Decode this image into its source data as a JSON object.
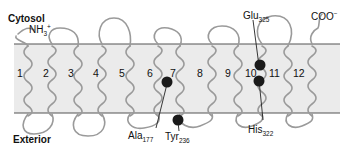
{
  "regions": {
    "top_label": "Cytosol",
    "bottom_label": "Exterior"
  },
  "termini": {
    "n_terminus": {
      "base": "NH",
      "sub": "3",
      "sup": "+"
    },
    "c_terminus": {
      "base": "COO",
      "sup": "−"
    }
  },
  "helices": [
    "1",
    "2",
    "3",
    "4",
    "5",
    "6",
    "7",
    "8",
    "9",
    "10",
    "11",
    "12"
  ],
  "residues": [
    {
      "name": "Ala",
      "number": "177"
    },
    {
      "name": "Tyr",
      "number": "236"
    },
    {
      "name": "Glu",
      "number": "325"
    },
    {
      "name": "His",
      "number": "322"
    }
  ],
  "colors": {
    "membrane_fill": "#ebebeb",
    "membrane_edge": "#555555",
    "chain": "#9a9a9a",
    "residue_dot": "#1a1a1a"
  }
}
